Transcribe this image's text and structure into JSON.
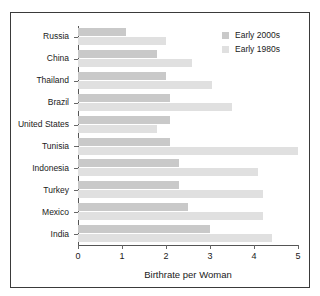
{
  "chart_data": {
    "type": "bar",
    "orientation": "horizontal",
    "title": "",
    "xlabel": "Birthrate per Woman",
    "ylabel": "",
    "xlim": [
      0,
      5
    ],
    "xticks": [
      0,
      1,
      2,
      3,
      4,
      5
    ],
    "xtick_labels": [
      "0",
      "1",
      "2",
      "3",
      "4",
      "5"
    ],
    "grid": false,
    "legend_position": "top-right",
    "categories": [
      "Russia",
      "China",
      "Thailand",
      "Brazil",
      "United States",
      "Tunisia",
      "Indonesia",
      "Turkey",
      "Mexico",
      "India"
    ],
    "series": [
      {
        "name": "Early 2000s",
        "color": "#c9c9c9",
        "values": [
          1.1,
          1.8,
          2.0,
          2.1,
          2.1,
          2.1,
          2.3,
          2.3,
          2.5,
          3.0
        ]
      },
      {
        "name": "Early 1980s",
        "color": "#e0e0e0",
        "values": [
          2.0,
          2.6,
          3.05,
          3.5,
          1.8,
          5.0,
          4.1,
          4.2,
          4.2,
          4.4
        ]
      }
    ]
  },
  "legend": {
    "items": [
      {
        "label": "Early 2000s",
        "color": "#c9c9c9"
      },
      {
        "label": "Early 1980s",
        "color": "#e0e0e0"
      }
    ]
  },
  "axis": {
    "x_title": "Birthrate per Woman"
  },
  "colors": {
    "frame": "#3a3a3a",
    "axis": "#555555",
    "background": "#ffffff",
    "series_recent": "#c9c9c9",
    "series_older": "#e0e0e0"
  }
}
